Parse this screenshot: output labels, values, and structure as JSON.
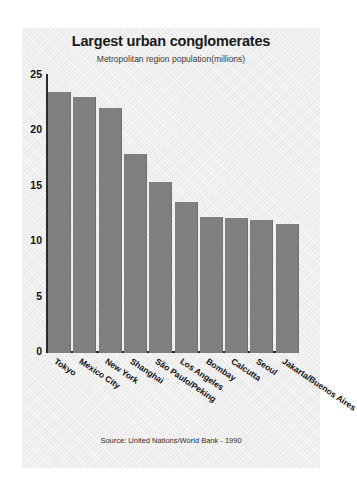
{
  "chart_data": {
    "type": "bar",
    "title": "Largest urban conglomerates",
    "subtitle": "Metropolitan region population(millions)",
    "source": "Source: United Nations/World Bank - 1990",
    "xlabel": "",
    "ylabel": "",
    "ylim": [
      0,
      25
    ],
    "yticks": [
      "0",
      "5",
      "10",
      "15",
      "20",
      "25"
    ],
    "ytick_values": [
      0,
      5,
      10,
      15,
      20,
      25
    ],
    "grid": false,
    "legend": "none",
    "bar_color": "#7f7f7f",
    "panel_color": "#ebebeb",
    "categories": [
      "Tokyo",
      "Mexico City",
      "New York",
      "Shanghai",
      "São Paulo/Peking",
      "Los Angeles",
      "Bombay",
      "Calcutta",
      "Seoul",
      "Jakarta/Buenos Aires"
    ],
    "values": [
      23.5,
      23.1,
      22.1,
      17.9,
      15.4,
      13.6,
      12.2,
      12.1,
      12.0,
      11.6
    ]
  }
}
